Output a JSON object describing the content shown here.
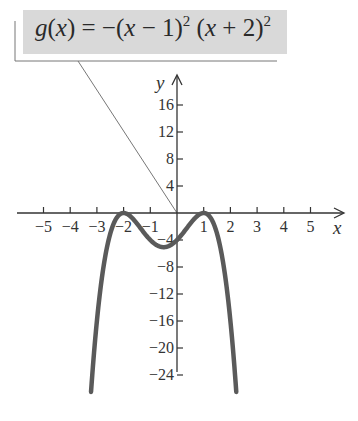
{
  "chart_data": {
    "type": "line",
    "formula": {
      "lhs": "g(x) = −(x − 1)",
      "exp1": "2",
      "mid": " (x + 2)",
      "exp2": "2"
    },
    "xlabel": "x",
    "ylabel": "y",
    "xlim": [
      -5.5,
      5.8
    ],
    "ylim": [
      -27,
      20
    ],
    "x_ticks": [
      -5,
      -4,
      -3,
      -2,
      -1,
      1,
      2,
      3,
      4,
      5
    ],
    "x_tick_labels": [
      "−5",
      "−4",
      "−3",
      "−2",
      "−1",
      "1",
      "2",
      "3",
      "4",
      "5"
    ],
    "y_ticks": [
      16,
      12,
      8,
      4,
      -4,
      -8,
      -12,
      -16,
      -20,
      -24
    ],
    "y_tick_labels": [
      "16",
      "12",
      "8",
      "4",
      "−4",
      "−8",
      "−12",
      "−16",
      "−20",
      "−24"
    ],
    "grid": false,
    "legend": null,
    "series": [
      {
        "name": "g(x) = −(x−1)^2 (x+2)^2",
        "color": "#5a5a5a",
        "x": [
          -3.22,
          -3.0,
          -2.75,
          -2.5,
          -2.25,
          -2.0,
          -1.75,
          -1.5,
          -1.25,
          -1.0,
          -0.75,
          -0.5,
          -0.25,
          0.0,
          0.25,
          0.5,
          0.75,
          1.0,
          1.25,
          1.5,
          1.75,
          2.0,
          2.22
        ],
        "y": [
          -26.6,
          -16.0,
          -8.27,
          -3.06,
          -0.66,
          0.0,
          -0.49,
          -1.56,
          -2.87,
          -4.0,
          -4.73,
          -5.06,
          -4.97,
          -4.0,
          -2.87,
          -1.56,
          -0.49,
          0.0,
          -0.66,
          -3.06,
          -8.27,
          -16.0,
          -26.6
        ]
      }
    ],
    "annotations": [
      {
        "text": "g(x) = −(x − 1)^2 (x + 2)^2",
        "points_to": [
          0,
          0
        ],
        "style": "gray label box with leader line"
      }
    ]
  }
}
